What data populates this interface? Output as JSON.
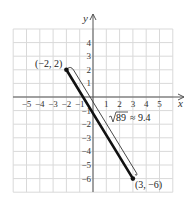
{
  "chart_data": {
    "type": "line",
    "title": "",
    "xlabel": "x",
    "ylabel": "y",
    "xlim": [
      -6,
      6
    ],
    "ylim": [
      -7,
      5
    ],
    "grid": true,
    "x_ticks": [
      -5,
      -4,
      -3,
      -2,
      -1,
      1,
      2,
      3,
      4,
      5
    ],
    "y_ticks": [
      4,
      3,
      2,
      1,
      -1,
      -2,
      -3,
      -4,
      -5,
      -6
    ],
    "x_tick_labels": [
      "−5",
      "−4",
      "−3",
      "−2",
      "−1",
      "1",
      "2",
      "3",
      "4",
      "5"
    ],
    "y_tick_labels": [
      "4",
      "3",
      "2",
      "1",
      "−1",
      "−2",
      "−3",
      "−4",
      "−5",
      "−6"
    ],
    "series": [
      {
        "name": "segment",
        "points": [
          {
            "x": -2,
            "y": 2
          },
          {
            "x": 3,
            "y": -6
          }
        ]
      }
    ],
    "annotations": [
      {
        "text": "(−2, 2)",
        "x": -2,
        "y": 2,
        "position": "left"
      },
      {
        "text": "(3, −6)",
        "x": 3,
        "y": -6,
        "position": "below-right"
      },
      {
        "text": "√89 ≈ 9.4",
        "radicand": "89",
        "approx": "≈ 9.4",
        "target": "segment-length"
      }
    ],
    "colors": {
      "segment": "#111111",
      "grid": "#d9d9d9",
      "axis": "#555555",
      "bracket": "#333333"
    }
  }
}
